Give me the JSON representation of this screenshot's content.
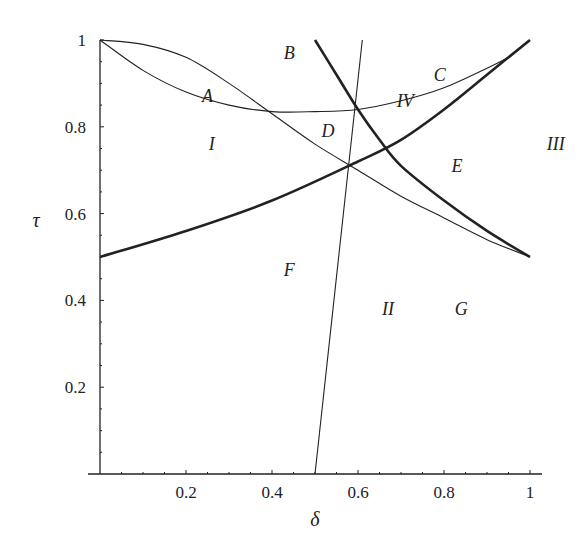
{
  "chart_data": {
    "type": "line",
    "title": "",
    "xlabel": "δ",
    "ylabel": "τ",
    "xlim": [
      0,
      1
    ],
    "ylim": [
      0,
      1
    ],
    "grid": false,
    "x_ticks": [
      "0.2",
      "0.4",
      "0.6",
      "0.8",
      "1"
    ],
    "y_ticks": [
      "0.2",
      "0.4",
      "0.6",
      "0.8",
      "1"
    ],
    "series": [
      {
        "name": "thin curve from (0,1) dipping to min ~0.835 at δ≈0.4 rising to (0.95,0.96)",
        "weight": "thin",
        "x": [
          0.0,
          0.1,
          0.2,
          0.3,
          0.4,
          0.5,
          0.6,
          0.7,
          0.8,
          0.9,
          0.95
        ],
        "y": [
          1.0,
          0.93,
          0.88,
          0.85,
          0.835,
          0.835,
          0.84,
          0.86,
          0.89,
          0.935,
          0.96
        ]
      },
      {
        "name": "thin curve from (0,1) decreasing to (1,0.5)",
        "weight": "thin",
        "x": [
          0.0,
          0.1,
          0.2,
          0.3,
          0.4,
          0.5,
          0.6,
          0.7,
          0.8,
          0.9,
          1.0
        ],
        "y": [
          1.0,
          0.99,
          0.96,
          0.9,
          0.83,
          0.76,
          0.7,
          0.64,
          0.59,
          0.54,
          0.5
        ]
      },
      {
        "name": "thin nearly vertical line",
        "weight": "thin",
        "x": [
          0.5,
          0.61
        ],
        "y": [
          0.0,
          1.0
        ]
      },
      {
        "name": "thick curve increasing from (0,0.5) to (1,1)",
        "weight": "thick",
        "x": [
          0.0,
          0.2,
          0.4,
          0.6,
          0.7,
          0.8,
          0.9,
          1.0
        ],
        "y": [
          0.5,
          0.56,
          0.63,
          0.72,
          0.77,
          0.84,
          0.92,
          1.0
        ]
      },
      {
        "name": "thick curve decreasing from (0.5,1) to (1,0.5)",
        "weight": "thick",
        "x": [
          0.5,
          0.55,
          0.6,
          0.65,
          0.7,
          0.8,
          0.9,
          1.0
        ],
        "y": [
          1.0,
          0.92,
          0.84,
          0.77,
          0.71,
          0.63,
          0.56,
          0.5
        ]
      }
    ],
    "annotations": [
      {
        "text": "A",
        "x": 0.25,
        "y": 0.87
      },
      {
        "text": "B",
        "x": 0.44,
        "y": 0.97
      },
      {
        "text": "C",
        "x": 0.79,
        "y": 0.92
      },
      {
        "text": "D",
        "x": 0.53,
        "y": 0.79
      },
      {
        "text": "E",
        "x": 0.83,
        "y": 0.71
      },
      {
        "text": "F",
        "x": 0.44,
        "y": 0.47
      },
      {
        "text": "G",
        "x": 0.84,
        "y": 0.38
      },
      {
        "text": "I",
        "x": 0.26,
        "y": 0.76
      },
      {
        "text": "II",
        "x": 0.67,
        "y": 0.38
      },
      {
        "text": "III",
        "x": 1.06,
        "y": 0.76
      },
      {
        "text": "IV",
        "x": 0.71,
        "y": 0.86
      }
    ]
  }
}
